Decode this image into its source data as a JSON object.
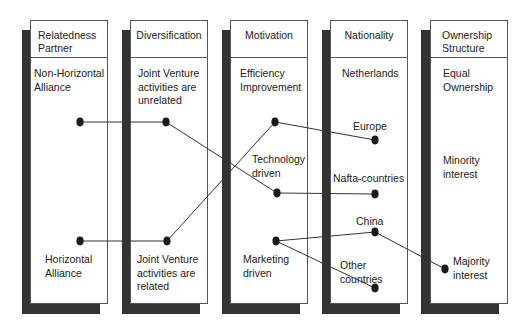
{
  "diagram": {
    "columns": [
      {
        "id": "relatedness",
        "header": [
          "Relatedness",
          "Partner"
        ],
        "labels": [
          {
            "lines": [
              "Non-Horizontal",
              "Alliance"
            ]
          },
          {
            "lines": [
              "Horizontal",
              "Alliance"
            ]
          }
        ]
      },
      {
        "id": "diversification",
        "header": [
          "Diversification"
        ],
        "labels": [
          {
            "lines": [
              "Joint Venture",
              "activities are",
              "unrelated"
            ]
          },
          {
            "lines": [
              "Joint Venture",
              "activities are",
              "related"
            ]
          }
        ]
      },
      {
        "id": "motivation",
        "header": [
          "Motivation"
        ],
        "labels": [
          {
            "lines": [
              "Efficiency",
              "Improvement"
            ]
          },
          {
            "lines": [
              "Technology",
              "driven"
            ]
          },
          {
            "lines": [
              "Marketing",
              "driven"
            ]
          }
        ]
      },
      {
        "id": "nationality",
        "header": [
          "Nationality"
        ],
        "labels": [
          {
            "lines": [
              "Netherlands"
            ]
          },
          {
            "lines": [
              "Europe"
            ]
          },
          {
            "lines": [
              "Nafta-countries"
            ]
          },
          {
            "lines": [
              "China"
            ]
          },
          {
            "lines": [
              "Other",
              "countries"
            ]
          }
        ]
      },
      {
        "id": "ownership",
        "header": [
          "Ownership",
          "Structure"
        ],
        "labels": [
          {
            "lines": [
              "Equal",
              "Ownership"
            ]
          },
          {
            "lines": [
              "Minority",
              "interest"
            ]
          },
          {
            "lines": [
              "Majority",
              "interest"
            ]
          }
        ]
      }
    ],
    "nodes": [
      {
        "id": "non-horizontal",
        "x": 80,
        "y": 122
      },
      {
        "id": "horizontal",
        "x": 80,
        "y": 241
      },
      {
        "id": "jv-unrelated",
        "x": 166,
        "y": 122
      },
      {
        "id": "jv-related",
        "x": 167,
        "y": 241
      },
      {
        "id": "efficiency",
        "x": 275,
        "y": 122
      },
      {
        "id": "technology",
        "x": 277,
        "y": 193
      },
      {
        "id": "marketing",
        "x": 276,
        "y": 241
      },
      {
        "id": "europe",
        "x": 375,
        "y": 140
      },
      {
        "id": "nafta",
        "x": 375,
        "y": 194
      },
      {
        "id": "china",
        "x": 375,
        "y": 232
      },
      {
        "id": "other-countries",
        "x": 375,
        "y": 288
      },
      {
        "id": "majority",
        "x": 445,
        "y": 269
      }
    ],
    "edges": [
      {
        "from": "non-horizontal",
        "to": "jv-unrelated"
      },
      {
        "from": "horizontal",
        "to": "jv-related"
      },
      {
        "from": "jv-unrelated",
        "to": "technology"
      },
      {
        "from": "jv-related",
        "to": "efficiency"
      },
      {
        "from": "efficiency",
        "to": "europe"
      },
      {
        "from": "technology",
        "to": "nafta"
      },
      {
        "from": "marketing",
        "to": "china"
      },
      {
        "from": "marketing",
        "to": "other-countries"
      },
      {
        "from": "china",
        "to": "majority"
      }
    ],
    "colors": {
      "shadow": "#333333",
      "line": "#333333",
      "dot": "#1a1a1a",
      "border": "#555555"
    }
  }
}
